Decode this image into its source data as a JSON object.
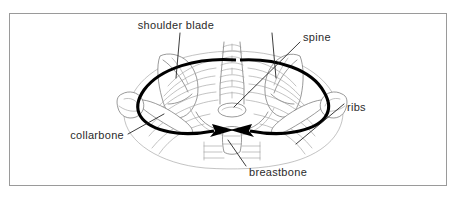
{
  "figure": {
    "border_color": "#9a9a9a",
    "background_color": "#ffffff",
    "line_color": "#6e6e6e",
    "arrow_color": "#000000",
    "label_color": "#2b2b2b"
  },
  "labels": {
    "shoulder_blade": "shoulder blade",
    "spine": "spine",
    "ribs": "ribs",
    "collarbone": "collarbone",
    "breastbone": "breastbone"
  },
  "structures": [
    {
      "name": "shoulder-blade",
      "label": "shoulder blade"
    },
    {
      "name": "spine",
      "label": "spine"
    },
    {
      "name": "ribs",
      "label": "ribs"
    },
    {
      "name": "collarbone",
      "label": "collarbone"
    },
    {
      "name": "breastbone",
      "label": "breastbone"
    }
  ],
  "arrows": {
    "count": 2,
    "direction": "inward toward breastbone",
    "style": "bold curved"
  }
}
